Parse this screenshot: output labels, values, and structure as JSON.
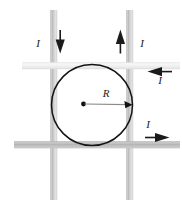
{
  "figure": {
    "kind": "physics-diagram",
    "background_color": "#ffffff",
    "canvas": {
      "width": 182,
      "height": 209
    }
  },
  "loop": {
    "label": "R",
    "center_dot_color": "#000000",
    "stroke_color": "#000000",
    "center": {
      "x": 83,
      "y": 104
    },
    "radius": 40
  },
  "wires": [
    {
      "id": "wire-left-vertical",
      "orientation": "vertical",
      "current_label": "I",
      "current_direction": "down",
      "color": "#c8c8c8",
      "x": 54
    },
    {
      "id": "wire-right-vertical",
      "orientation": "vertical",
      "current_label": "I",
      "current_direction": "up",
      "color": "#c8c8c8",
      "x": 130
    },
    {
      "id": "wire-top-horizontal",
      "orientation": "horizontal",
      "current_label": "I",
      "current_direction": "left",
      "color": "#f0f0f0",
      "y": 66
    },
    {
      "id": "wire-bottom-horizontal",
      "orientation": "horizontal",
      "current_label": "I",
      "current_direction": "right",
      "color": "#b4b4b4",
      "y": 145
    }
  ],
  "arrows": [
    {
      "id": "arrow-left-down",
      "label": "I",
      "direction": "down"
    },
    {
      "id": "arrow-right-up",
      "label": "I",
      "direction": "up"
    },
    {
      "id": "arrow-top-left",
      "label": "I",
      "direction": "left"
    },
    {
      "id": "arrow-bottom-right",
      "label": "I",
      "direction": "right"
    }
  ],
  "labels": {
    "left_vertical_current": "I",
    "right_vertical_current": "I",
    "top_horizontal_current": "I",
    "bottom_horizontal_current": "I",
    "radius": "R"
  }
}
